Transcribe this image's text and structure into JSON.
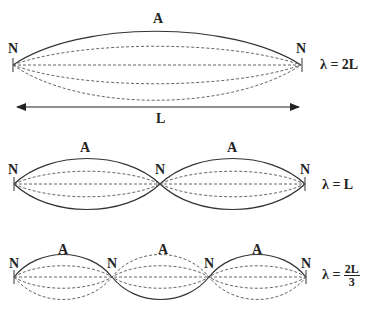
{
  "diagrams": [
    {
      "name": "fundamental",
      "node_label": "N",
      "antinode_label": "A",
      "equation": {
        "lhs": "λ = ",
        "value": "2L"
      },
      "length_label": "L"
    },
    {
      "name": "second-harmonic",
      "node_label": "N",
      "antinode_label": "A",
      "equation": {
        "lhs": "λ = ",
        "value": "L"
      }
    },
    {
      "name": "third-harmonic",
      "node_label": "N",
      "antinode_label": "A",
      "equation": {
        "lhs": "λ = ",
        "numerator": "2L",
        "denominator": "3"
      }
    }
  ],
  "colors": {
    "line": "#333333",
    "dashed": "#555555"
  }
}
